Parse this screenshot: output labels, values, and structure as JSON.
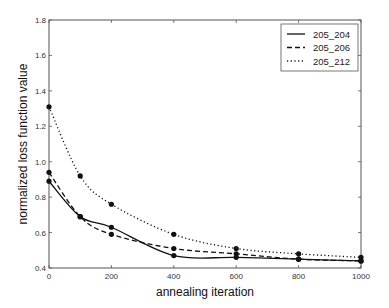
{
  "chart_data": {
    "type": "line",
    "title": "",
    "xlabel": "annealing iteration",
    "ylabel": "normalized loss function value",
    "xlim": [
      0,
      1000
    ],
    "ylim": [
      0.4,
      1.8
    ],
    "xticks": [
      0,
      200,
      400,
      600,
      800,
      1000
    ],
    "yticks": [
      0.4,
      0.6,
      0.8,
      1.0,
      1.2,
      1.4,
      1.6,
      1.8
    ],
    "xtick_labels": [
      "0",
      "200",
      "400",
      "600",
      "800",
      "1000"
    ],
    "ytick_labels": [
      "0.4",
      "0.6",
      "0.8",
      "1.0",
      "1.2",
      "1.4",
      "1.6",
      "1.8"
    ],
    "grid": false,
    "legend_position": "upper right",
    "x": [
      0,
      100,
      200,
      400,
      600,
      800,
      1000
    ],
    "series": [
      {
        "name": "205_204",
        "style": "solid",
        "values": [
          0.89,
          0.69,
          0.63,
          0.47,
          0.46,
          0.45,
          0.44
        ]
      },
      {
        "name": "205_206",
        "style": "dashed",
        "values": [
          0.94,
          0.69,
          0.59,
          0.51,
          0.48,
          0.45,
          0.44
        ]
      },
      {
        "name": "205_212",
        "style": "dashdot",
        "values": [
          1.31,
          0.92,
          0.76,
          0.59,
          0.51,
          0.48,
          0.46
        ]
      }
    ]
  }
}
